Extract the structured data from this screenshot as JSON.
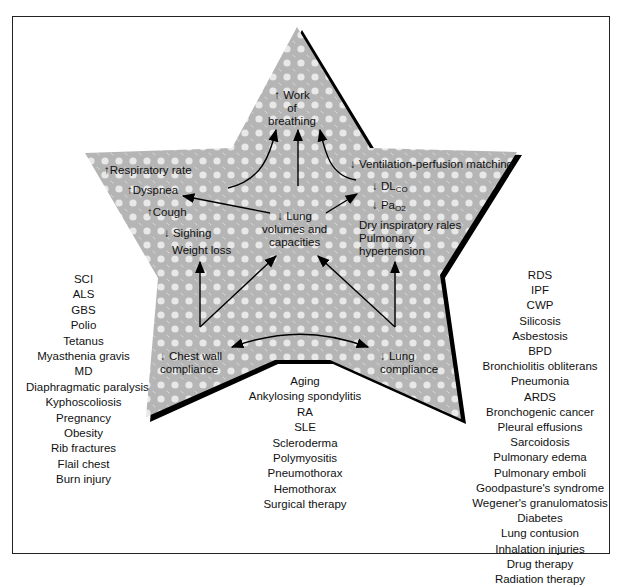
{
  "center": {
    "top": {
      "arrow": "↑",
      "lines": [
        "Work",
        "of",
        "breathing"
      ]
    },
    "lung_volumes": {
      "arrow": "↓",
      "lines": [
        "Lung",
        "volumes and",
        "capacities"
      ]
    },
    "chest_wall": {
      "arrow": "↓",
      "lines": [
        "Chest wall",
        "compliance"
      ]
    },
    "lung_compliance": {
      "arrow": "↓",
      "lines": [
        "Lung",
        "compliance"
      ]
    }
  },
  "left_effects": [
    {
      "arrow": "↑",
      "text": "Respiratory rate"
    },
    {
      "arrow": "↑",
      "text": "Dyspnea"
    },
    {
      "arrow": "↑",
      "text": "Cough"
    },
    {
      "arrow": "↓",
      "text": "Sighing"
    },
    {
      "arrow": "",
      "text": "Weight loss"
    }
  ],
  "right_effects": [
    {
      "arrow": "↓",
      "text": "Ventilation-perfusion matching"
    },
    {
      "arrow": "↓",
      "text": "DL",
      "sub": "CO"
    },
    {
      "arrow": "↓",
      "text": "Pa",
      "sub": "O2"
    },
    {
      "arrow": "",
      "text": "Dry inspiratory rales"
    },
    {
      "arrow": "",
      "text": "Pulmonary"
    },
    {
      "arrow": "",
      "text": "hypertension"
    }
  ],
  "left_list": [
    "SCI",
    "ALS",
    "GBS",
    "Polio",
    "Tetanus",
    "Myasthenia gravis",
    "MD",
    "Diaphragmatic paralysis",
    "Kyphoscoliosis",
    "Pregnancy",
    "Obesity",
    "Rib fractures",
    "Flail chest",
    "Burn injury"
  ],
  "bottom_list": [
    "Aging",
    "Ankylosing spondylitis",
    "RA",
    "SLE",
    "Scleroderma",
    "Polymyositis",
    "Pneumothorax",
    "Hemothorax",
    "Surgical therapy"
  ],
  "right_list": [
    "RDS",
    "IPF",
    "CWP",
    "Silicosis",
    "Asbestosis",
    "BPD",
    "Bronchiolitis obliterans",
    "Pneumonia",
    "ARDS",
    "Bronchogenic cancer",
    "Pleural effusions",
    "Sarcoidosis",
    "Pulmonary edema",
    "Pulmonary emboli",
    "Goodpasture's syndrome",
    "Wegener's granulomatosis",
    "Diabetes",
    "Lung contusion",
    "Inhalation injuries",
    "Drug therapy",
    "Radiation therapy"
  ],
  "colors": {
    "star_fill": "#b8b8b8",
    "star_dots": "#e6e6e6",
    "shadow": "#000000",
    "frame": "#222222"
  }
}
